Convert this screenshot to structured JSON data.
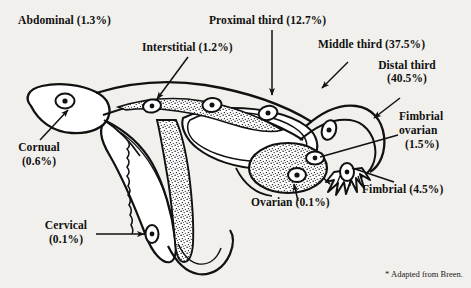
{
  "figure": {
    "background_color": "#f2f0ec",
    "ink_color": "#111111",
    "credit": "* Adapted from Breen."
  },
  "labels": [
    {
      "id": "abdominal",
      "text": "Abdominal (1.3%)",
      "site": "Abdominal",
      "percent": "1.3%",
      "has_arrow": false
    },
    {
      "id": "interstitial",
      "text": "Interstitial (1.2%)",
      "site": "Interstitial",
      "percent": "1.2%",
      "has_arrow": true
    },
    {
      "id": "proximal",
      "text": "Proximal third (12.7%)",
      "site": "Proximal third",
      "percent": "12.7%",
      "has_arrow": true
    },
    {
      "id": "middle",
      "text": "Middle third (37.5%)",
      "site": "Middle third",
      "percent": "37.5%",
      "has_arrow": true
    },
    {
      "id": "distal_l1",
      "text": "Distal third",
      "site": "Distal third",
      "percent": "40.5%",
      "has_arrow": true
    },
    {
      "id": "distal_l2",
      "text": "(40.5%)"
    },
    {
      "id": "fimbrial_ov_l1",
      "text": "Fimbrial",
      "site": "Fimbrial ovarian",
      "percent": "1.5%",
      "has_arrow": true
    },
    {
      "id": "fimbrial_ov_l2",
      "text": "ovarian"
    },
    {
      "id": "fimbrial_ov_l3",
      "text": "(1.5%)"
    },
    {
      "id": "fimbrial",
      "text": "Fimbrial (4.5%)",
      "site": "Fimbrial",
      "percent": "4.5%",
      "has_arrow": true
    },
    {
      "id": "ovarian",
      "text": "Ovarian (0.1%)",
      "site": "Ovarian",
      "percent": "0.1%",
      "has_arrow": true
    },
    {
      "id": "cervical_l1",
      "text": "Cervical",
      "site": "Cervical",
      "percent": "0.1%",
      "has_arrow": true
    },
    {
      "id": "cervical_l2",
      "text": "(0.1%)"
    },
    {
      "id": "cornual_l1",
      "text": "Cornual",
      "site": "Cornual",
      "percent": "0.6%",
      "has_arrow": true
    },
    {
      "id": "cornual_l2",
      "text": "(0.6%)"
    }
  ]
}
